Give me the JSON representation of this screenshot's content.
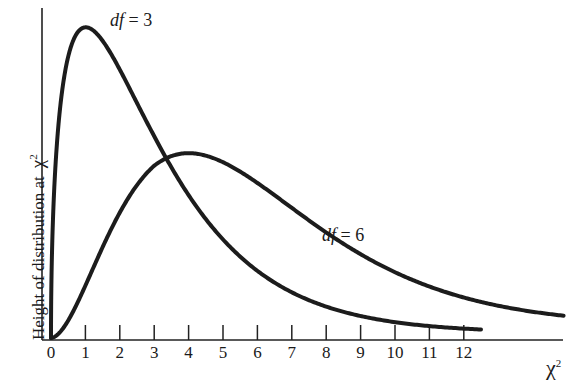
{
  "chart_data": {
    "type": "line",
    "title": "",
    "xlabel": "χ",
    "xlabel_superscript": "2",
    "ylabel": "Height of distribution at",
    "ylabel_symbol": "χ",
    "ylabel_superscript": "2",
    "x_ticks": [
      0,
      1,
      2,
      3,
      4,
      5,
      6,
      7,
      8,
      9,
      10,
      11,
      12
    ],
    "xlim": [
      0,
      14.9
    ],
    "y_ticks": [],
    "grid": false,
    "legend": "inline labels on curves",
    "series": [
      {
        "name": "df = 3",
        "df_prefix": "df",
        "df_value": "= 3",
        "df": 3,
        "x_end": 12.5,
        "peak": {
          "x": 1,
          "y": 0.242
        },
        "values_sampled": {
          "x": [
            0,
            0.25,
            0.5,
            1,
            2,
            3,
            4,
            5,
            6,
            8,
            10,
            12
          ],
          "y": [
            0,
            0.196,
            0.22,
            0.242,
            0.208,
            0.154,
            0.108,
            0.073,
            0.048,
            0.021,
            0.008,
            0.003
          ]
        }
      },
      {
        "name": "df = 6",
        "df_prefix": "df",
        "df_value": "= 6",
        "df": 6,
        "x_end": 14.9,
        "peak": {
          "x": 4,
          "y": 0.135
        },
        "values_sampled": {
          "x": [
            0,
            1,
            2,
            3,
            4,
            5,
            6,
            8,
            10,
            12,
            14
          ],
          "y": [
            0,
            0.038,
            0.092,
            0.126,
            0.135,
            0.128,
            0.112,
            0.073,
            0.042,
            0.022,
            0.011
          ]
        }
      }
    ]
  }
}
